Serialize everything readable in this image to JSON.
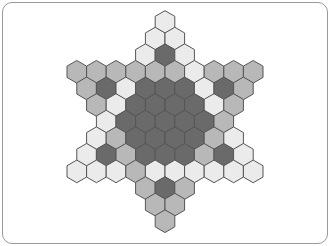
{
  "board": {
    "type": "hexagram-hex-board",
    "colors": {
      "D": "#6a6a6a",
      "M": "#b8b8b8",
      "L": "#ebebeb"
    },
    "stroke": "#555555",
    "center_x": 165,
    "row0_y": 22,
    "hex_width": 19.6,
    "row_step": 16.6,
    "rows": [
      [
        "L"
      ],
      [
        "L",
        "L"
      ],
      [
        "L",
        "D",
        "L"
      ],
      [
        "M",
        "M",
        "M",
        "M",
        "M",
        "M",
        "L",
        "M",
        "M",
        "M"
      ],
      [
        "M",
        "D",
        "L",
        "D",
        "D",
        "D",
        "L",
        "D",
        "M"
      ],
      [
        "M",
        "L",
        "D",
        "D",
        "D",
        "D",
        "L",
        "M"
      ],
      [
        "L",
        "D",
        "D",
        "D",
        "D",
        "D",
        "M"
      ],
      [
        "L",
        "M",
        "D",
        "D",
        "D",
        "D",
        "M",
        "L"
      ],
      [
        "L",
        "D",
        "M",
        "D",
        "D",
        "D",
        "M",
        "D",
        "L"
      ],
      [
        "L",
        "L",
        "L",
        "M",
        "L",
        "L",
        "L",
        "L",
        "L",
        "L"
      ],
      [
        "M",
        "D",
        "M"
      ],
      [
        "M",
        "M"
      ],
      [
        "M"
      ]
    ]
  }
}
